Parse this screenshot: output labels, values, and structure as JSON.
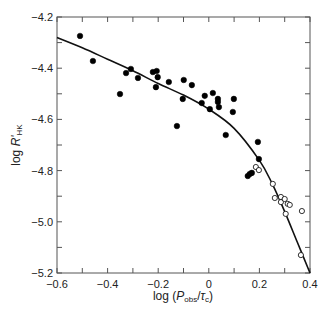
{
  "chart_data": {
    "type": "scatter",
    "title": "",
    "xlabel": "log (P_obs/τ_c)",
    "xlabel_parts": {
      "prefix": "log (",
      "P": "P",
      "obs": "obs",
      "slash": "/",
      "tau": "τ",
      "c": "c",
      "suffix": ")"
    },
    "ylabel": "log R'HK",
    "ylabel_parts": {
      "prefix": "log ",
      "R": "R'",
      "sub": "HK"
    },
    "xlim": [
      -0.6,
      0.4
    ],
    "ylim": [
      -5.2,
      -4.2
    ],
    "xticks": [
      -0.6,
      -0.4,
      -0.2,
      0,
      0.2,
      0.4
    ],
    "xtick_labels": [
      "−0.6",
      "−0.4",
      "−0.2",
      "0",
      "0.2",
      "0.4"
    ],
    "yticks": [
      -4.2,
      -4.4,
      -4.6,
      -4.8,
      -5.0,
      -5.2
    ],
    "ytick_labels": [
      "−4.2",
      "−4.4",
      "−4.6",
      "−4.8",
      "−5.0",
      "−5.2"
    ],
    "grid": false,
    "legend": null,
    "series": [
      {
        "name": "filled",
        "marker": "filled-circle",
        "points": [
          [
            -0.509,
            -4.274
          ],
          [
            -0.458,
            -4.372
          ],
          [
            -0.351,
            -4.501
          ],
          [
            -0.327,
            -4.419
          ],
          [
            -0.308,
            -4.403
          ],
          [
            -0.28,
            -4.438
          ],
          [
            -0.221,
            -4.415
          ],
          [
            -0.206,
            -4.411
          ],
          [
            -0.202,
            -4.435
          ],
          [
            -0.209,
            -4.474
          ],
          [
            -0.158,
            -4.454
          ],
          [
            -0.099,
            -4.446
          ],
          [
            -0.067,
            -4.466
          ],
          [
            -0.103,
            -4.52
          ],
          [
            -0.126,
            -4.626
          ],
          [
            -0.028,
            -4.536
          ],
          [
            -0.016,
            -4.508
          ],
          [
            0.016,
            -4.497
          ],
          [
            0.036,
            -4.52
          ],
          [
            0.036,
            -4.532
          ],
          [
            0.004,
            -4.56
          ],
          [
            0.04,
            -4.552
          ],
          [
            0.099,
            -4.52
          ],
          [
            0.095,
            -4.571
          ],
          [
            0.067,
            -4.661
          ],
          [
            0.194,
            -4.688
          ],
          [
            0.198,
            -4.755
          ],
          [
            0.154,
            -4.821
          ],
          [
            0.162,
            -4.813
          ],
          [
            0.17,
            -4.809
          ]
        ]
      },
      {
        "name": "open",
        "marker": "open-circle",
        "points": [
          [
            0.186,
            -4.786
          ],
          [
            0.198,
            -4.798
          ],
          [
            0.253,
            -4.852
          ],
          [
            0.261,
            -4.907
          ],
          [
            0.285,
            -4.923
          ],
          [
            0.285,
            -4.903
          ],
          [
            0.3,
            -4.911
          ],
          [
            0.312,
            -4.93
          ],
          [
            0.32,
            -4.934
          ],
          [
            0.304,
            -4.969
          ],
          [
            0.368,
            -4.958
          ],
          [
            0.364,
            -5.13
          ]
        ]
      }
    ],
    "fit_curve": {
      "name": "fit",
      "points": [
        [
          -0.6,
          -4.28
        ],
        [
          -0.5,
          -4.32
        ],
        [
          -0.4,
          -4.365
        ],
        [
          -0.3,
          -4.41
        ],
        [
          -0.2,
          -4.46
        ],
        [
          -0.1,
          -4.505
        ],
        [
          0.0,
          -4.56
        ],
        [
          0.1,
          -4.635
        ],
        [
          0.2,
          -4.76
        ],
        [
          0.25,
          -4.85
        ],
        [
          0.3,
          -4.96
        ],
        [
          0.35,
          -5.08
        ],
        [
          0.4,
          -5.2
        ]
      ]
    },
    "colors": {
      "marker": "#000000",
      "curve": "#111111",
      "axis": "#555555",
      "text": "#222222"
    }
  }
}
